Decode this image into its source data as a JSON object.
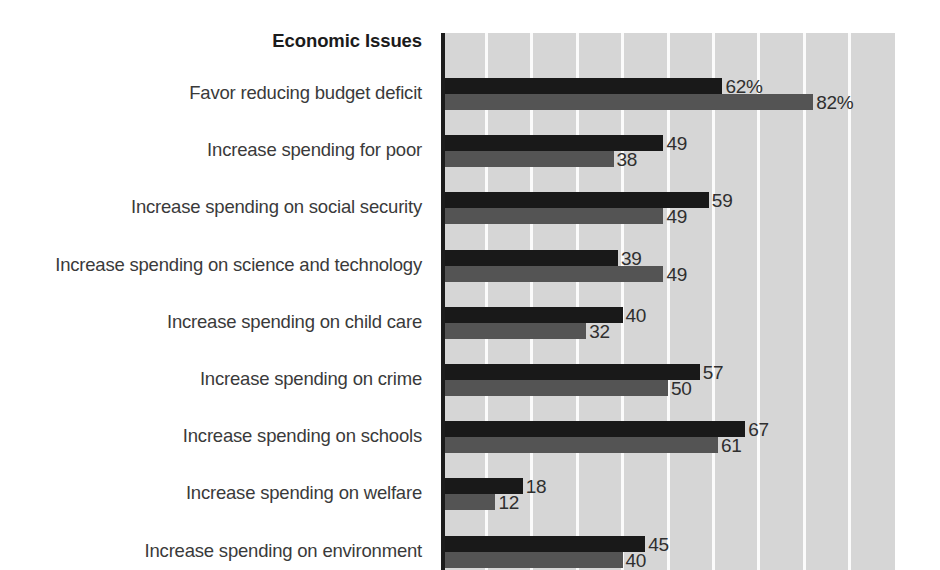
{
  "chart_data": {
    "type": "bar",
    "orientation": "horizontal",
    "title": "Economic Issues",
    "xlabel": "",
    "ylabel": "",
    "xlim": [
      0,
      100
    ],
    "grid": true,
    "grid_orientation": "vertical",
    "grid_step": 10,
    "legend": "none",
    "value_labels_shown": true,
    "note": "bottom category row is cropped by the screenshot edge",
    "categories": [
      "Favor reducing budget deficit",
      "Increase spending for poor",
      "Increase spending on social security",
      "Increase spending on science and technology",
      "Increase spending on child care",
      "Increase spending on crime",
      "Increase spending on schools",
      "Increase spending on welfare",
      "Increase spending on environment"
    ],
    "series": [
      {
        "name": "series-dark",
        "color": "#191919",
        "values": [
          62,
          49,
          59,
          39,
          40,
          57,
          67,
          18,
          45
        ],
        "labels": [
          "62%",
          "49",
          "59",
          "39",
          "40",
          "57",
          "67",
          "18",
          "45"
        ]
      },
      {
        "name": "series-gray",
        "color": "#545454",
        "values": [
          82,
          38,
          49,
          49,
          32,
          50,
          61,
          12,
          40
        ],
        "labels": [
          "82%",
          "38",
          "49",
          "49",
          "32",
          "50",
          "61",
          "12",
          "40"
        ]
      }
    ]
  },
  "colors": {
    "plot_background": "#d6d6d6",
    "gridline": "#fbfbfb",
    "axis": "#1c1c1c",
    "page_background": "#ffffff",
    "title_text": "#1b1b1b",
    "label_text": "#3a3a3a",
    "value_text": "#2f2f2f"
  }
}
